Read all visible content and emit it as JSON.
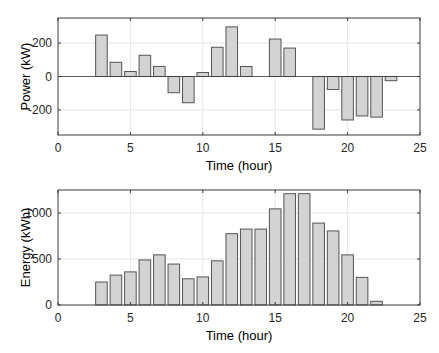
{
  "chart_data": [
    {
      "type": "bar",
      "title": "",
      "xlabel": "Time (hour)",
      "ylabel": "Power (kW)",
      "xlim": [
        0,
        25
      ],
      "ylim": [
        -350,
        350
      ],
      "xticks": [
        0,
        5,
        10,
        15,
        20,
        25
      ],
      "yticks": [
        -200,
        0,
        200
      ],
      "grid": true,
      "bar_color": "#d3d3d3",
      "edge_color": "#555555",
      "x": [
        3,
        4,
        5,
        6,
        7,
        8,
        9,
        10,
        11,
        12,
        13,
        15,
        16,
        18,
        19,
        20,
        21,
        22,
        23
      ],
      "values": [
        248,
        85,
        30,
        127,
        60,
        -97,
        -157,
        24,
        175,
        297,
        60,
        224,
        170,
        -315,
        -78,
        -260,
        -236,
        -243,
        -25
      ]
    },
    {
      "type": "bar",
      "title": "",
      "xlabel": "Time (hour)",
      "ylabel": "Energy (kWh)",
      "xlim": [
        0,
        25
      ],
      "ylim": [
        0,
        1250
      ],
      "xticks": [
        0,
        5,
        10,
        15,
        20,
        25
      ],
      "yticks": [
        0,
        500,
        1000
      ],
      "grid": true,
      "bar_color": "#d3d3d3",
      "edge_color": "#555555",
      "x": [
        3,
        4,
        5,
        6,
        7,
        8,
        9,
        10,
        11,
        12,
        13,
        14,
        15,
        16,
        17,
        18,
        19,
        20,
        21,
        22
      ],
      "values": [
        250,
        325,
        360,
        490,
        545,
        445,
        285,
        305,
        480,
        775,
        825,
        825,
        1045,
        1210,
        1210,
        890,
        805,
        545,
        300,
        40
      ]
    }
  ],
  "layout": [
    {
      "left": 58,
      "right": 420,
      "top": 18,
      "bottom": 135
    },
    {
      "left": 58,
      "right": 420,
      "top": 190,
      "bottom": 305
    }
  ],
  "colors": {
    "frame": "#3a3a3a",
    "grid": "#e6e6e6",
    "zero_line": "#3a3a3a"
  }
}
